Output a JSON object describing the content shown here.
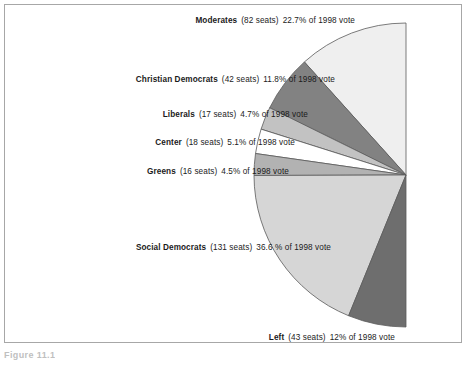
{
  "figure": {
    "caption": "Figure 11.1"
  },
  "chart_data": {
    "type": "pie",
    "title": "",
    "subtitle": "",
    "xlabel": "",
    "ylabel": "",
    "legend_position": "inline-labels-left",
    "grid": false,
    "shape": "half-pie-semicircle-opening-left",
    "total_seats": 349,
    "vote_year": "1998",
    "categories": [
      "Moderates",
      "Christian Democrats",
      "Liberals",
      "Center",
      "Greens",
      "Social Democrats",
      "Left"
    ],
    "values": [
      22.7,
      11.8,
      4.7,
      5.1,
      4.5,
      36.6,
      12
    ],
    "seats": [
      82,
      42,
      17,
      18,
      16,
      131,
      43
    ],
    "colors": [
      "#efefef",
      "#828282",
      "#c2c2c2",
      "#ffffff",
      "#b2b2b2",
      "#d6d6d6",
      "#6e6e6e"
    ],
    "slices": [
      {
        "name": "Moderates",
        "seats": 82,
        "percent": 22.7,
        "label_party": "Moderates",
        "label_seats": "(82 seats)",
        "label_pct": "22.7% of 1998 vote",
        "color": "#efefef"
      },
      {
        "name": "Christian Democrats",
        "seats": 42,
        "percent": 11.8,
        "label_party": "Christian Democrats",
        "label_seats": "(42 seats)",
        "label_pct": "11.8% of 1998 vote",
        "color": "#828282"
      },
      {
        "name": "Liberals",
        "seats": 17,
        "percent": 4.7,
        "label_party": "Liberals",
        "label_seats": "(17 seats)",
        "label_pct": "4.7% of 1998 vote",
        "color": "#c2c2c2"
      },
      {
        "name": "Center",
        "seats": 18,
        "percent": 5.1,
        "label_party": "Center",
        "label_seats": "(18 seats)",
        "label_pct": "5.1% of 1998 vote",
        "color": "#ffffff"
      },
      {
        "name": "Greens",
        "seats": 16,
        "percent": 4.5,
        "label_party": "Greens",
        "label_seats": "(16 seats)",
        "label_pct": "4.5% of 1998 vote",
        "color": "#b2b2b2"
      },
      {
        "name": "Social Democrats",
        "seats": 131,
        "percent": 36.6,
        "label_party": "Social Democrats",
        "label_seats": "(131 seats)",
        "label_pct": "36.6 % of 1998 vote",
        "color": "#d6d6d6"
      },
      {
        "name": "Left",
        "seats": 43,
        "percent": 12,
        "label_party": "Left",
        "label_seats": "(43 seats)",
        "label_pct": "12% of 1998 vote",
        "color": "#6e6e6e"
      }
    ]
  },
  "style": {
    "frame_border": "#a7a7a7",
    "slice_outline": "#5a5a5a",
    "text": "#1b1b1b",
    "caption_text": "#bfbfbf"
  }
}
